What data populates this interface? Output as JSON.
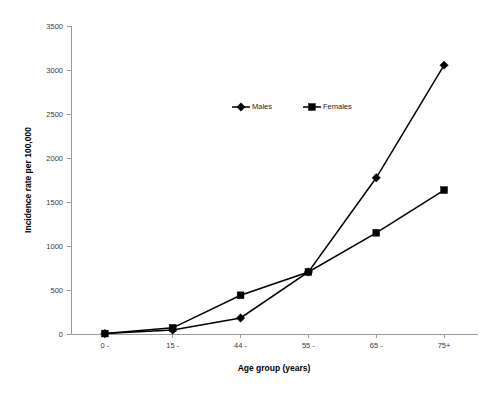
{
  "chart_data": {
    "type": "line",
    "title": "",
    "xlabel": "Age group (years)",
    "ylabel": "Incidence rate per 100,000",
    "categories": [
      "0 -",
      "15 -",
      "44 -",
      "55 -",
      "65 -",
      "75+"
    ],
    "ylim": [
      0,
      3500
    ],
    "yticks": [
      0,
      500,
      1000,
      1500,
      2000,
      2500,
      3000,
      3500
    ],
    "ytick_labels": [
      "0",
      "500",
      "1000",
      "1500",
      "2000",
      "2500",
      "3000",
      "3500"
    ],
    "grid": false,
    "legend_position": "upper-center",
    "series": [
      {
        "name": "Males",
        "marker": "diamond",
        "color": "#000000",
        "values": [
          5,
          45,
          182,
          705,
          1775,
          3055
        ]
      },
      {
        "name": "Females",
        "marker": "square",
        "color": "#000000",
        "values": [
          5,
          70,
          440,
          705,
          1150,
          1635
        ]
      }
    ]
  },
  "legend": {
    "items": [
      {
        "label": "Males",
        "marker": "diamond"
      },
      {
        "label": "Females",
        "marker": "square"
      }
    ]
  },
  "axes": {
    "y_title": "Incidence rate per 100,000",
    "x_title": "Age group (years)"
  }
}
